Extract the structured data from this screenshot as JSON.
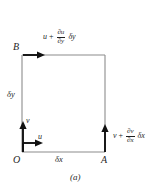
{
  "figure": {
    "caption": "(a)",
    "type": "fluid-element-velocity-diagram",
    "corners": {
      "origin": "O",
      "right": "A",
      "top": "B"
    },
    "dimensions": {
      "horizontal": "δx",
      "vertical": "δy"
    },
    "velocities": {
      "bottom": "u",
      "left": "v"
    },
    "expressions": {
      "top": {
        "base": "u",
        "operator": "+",
        "numerator": "∂u",
        "denominator": "∂y",
        "tail": "δy"
      },
      "right": {
        "base": "v",
        "operator": "+",
        "numerator": "∂v",
        "denominator": "∂x",
        "tail": "δx"
      }
    },
    "colors": {
      "line": "#8c8c8c",
      "arrow": "#111111",
      "text": "#1f1f1f",
      "background": "#ffffff"
    }
  }
}
